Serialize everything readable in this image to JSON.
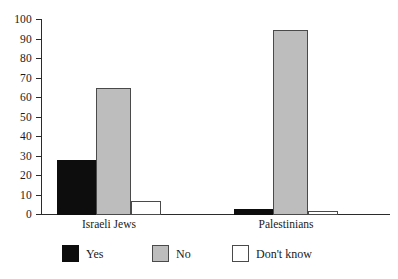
{
  "chart_data": {
    "type": "bar",
    "title": "",
    "subtitle": "",
    "xlabel": "",
    "ylabel": "",
    "ylim": [
      0,
      100
    ],
    "ytick_labels": [
      "100",
      "90",
      "80",
      "70",
      "60",
      "50",
      "40",
      "30",
      "20",
      "10",
      "0"
    ],
    "ytick_values": [
      100,
      90,
      80,
      70,
      60,
      50,
      40,
      30,
      20,
      10,
      0
    ],
    "grid": false,
    "legend_position": "bottom",
    "categories": [
      "Israeli Jews",
      "Palestinians"
    ],
    "series": [
      {
        "name": "Yes",
        "color": "#0d0d0d",
        "values": [
          28,
          3
        ]
      },
      {
        "name": "No",
        "color": "#bdbdbd",
        "values": [
          65,
          95
        ]
      },
      {
        "name": "Don't know",
        "color": "#ffffff",
        "values": [
          7,
          2
        ]
      }
    ]
  },
  "axis": {
    "y_ticks": [
      {
        "label": "100",
        "value": 100
      },
      {
        "label": "90",
        "value": 90
      },
      {
        "label": "80",
        "value": 80
      },
      {
        "label": "70",
        "value": 70
      },
      {
        "label": "60",
        "value": 60
      },
      {
        "label": "50",
        "value": 50
      },
      {
        "label": "40",
        "value": 40
      },
      {
        "label": "30",
        "value": 30
      },
      {
        "label": "20",
        "value": 20
      },
      {
        "label": "10",
        "value": 10
      },
      {
        "label": "0",
        "value": 0
      }
    ]
  },
  "groups": [
    {
      "label": "Israeli Jews"
    },
    {
      "label": "Palestinians"
    }
  ],
  "legend": {
    "items": [
      {
        "label": "Yes",
        "color": "#0d0d0d"
      },
      {
        "label": "No",
        "color": "#bdbdbd"
      },
      {
        "label": "Don't know",
        "color": "#ffffff"
      }
    ]
  }
}
